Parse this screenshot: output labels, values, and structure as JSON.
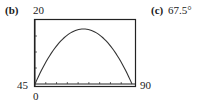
{
  "part_b": {
    "label": "(b)"
  },
  "part_c": {
    "label": "(c)",
    "answer": "67.5°"
  },
  "chart_data": {
    "type": "line",
    "title": "",
    "xlabel": "",
    "ylabel": "",
    "xlim": [
      45,
      90
    ],
    "ylim": [
      0,
      20
    ],
    "tick_labels": {
      "ymax": "20",
      "ymin": "0",
      "xmin": "45",
      "xmax": "90"
    },
    "x_tick_step": 5,
    "y_tick_step": 5,
    "grid": false,
    "series": [
      {
        "name": "curve",
        "x": [
          45,
          50,
          55,
          60,
          65,
          67.5,
          70,
          75,
          80,
          85,
          90
        ],
        "y": [
          0,
          6.6,
          11.6,
          15.1,
          17.0,
          17.2,
          17.0,
          15.1,
          11.6,
          6.6,
          0
        ]
      }
    ]
  }
}
